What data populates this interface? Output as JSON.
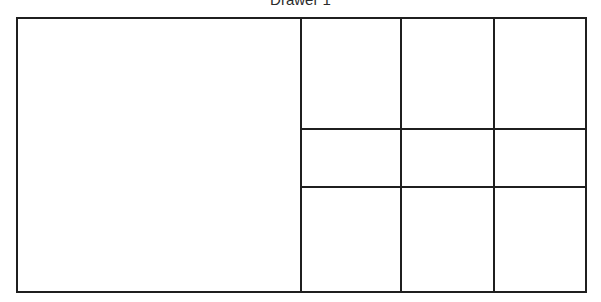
{
  "diagram": {
    "title": "Drawer 1",
    "grid": {
      "rows": 3,
      "cols": 3
    }
  },
  "colors": {
    "line": "#1f1f1f",
    "background": "#ffffff",
    "title_text": "#2b2b2b"
  }
}
